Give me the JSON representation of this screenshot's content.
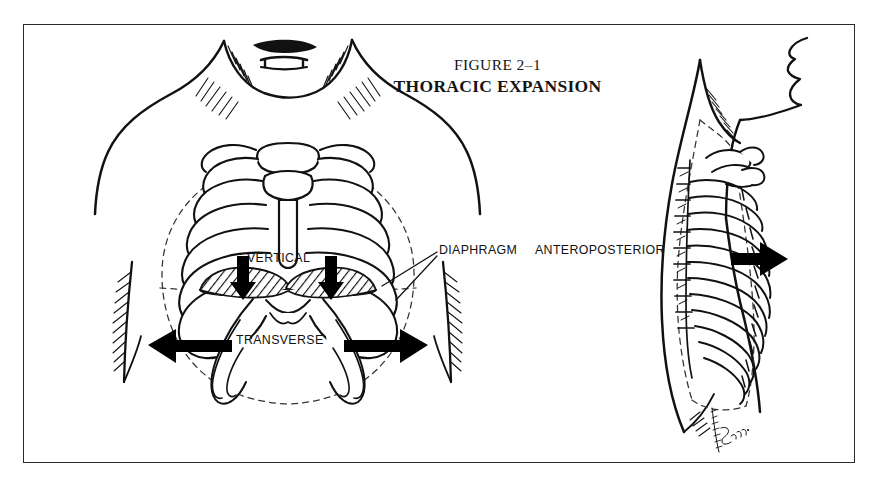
{
  "figure": {
    "number": "FIGURE 2–1",
    "title": "THORACIC EXPANSION",
    "background_color": "#ffffff",
    "ink_color": "#111111",
    "frame_color": "#2a2a2a",
    "artist_signature": "Esposito"
  },
  "labels": {
    "vertical": "VERTICAL",
    "transverse": "TRANSVERSE",
    "diaphragm": "DIAPHRAGM",
    "anteroposterior": "ANTEROPOSTERIOR"
  },
  "panels": [
    {
      "id": "anterior-view",
      "name": "Anterior thorax view",
      "dimensions_shown": [
        "VERTICAL",
        "TRANSVERSE"
      ],
      "structures": [
        "sternum",
        "manubrium",
        "ribs",
        "costal-cartilage",
        "diaphragm",
        "neck",
        "shoulders",
        "arms"
      ]
    },
    {
      "id": "lateral-view",
      "name": "Lateral thorax view",
      "dimensions_shown": [
        "ANTEROPOSTERIOR"
      ],
      "structures": [
        "ribs",
        "vertebral-column",
        "scapula",
        "head-profile",
        "neck"
      ]
    }
  ],
  "arrows": [
    {
      "name": "vertical-arrow-left",
      "direction": "down",
      "panel": "anterior-view"
    },
    {
      "name": "vertical-arrow-right",
      "direction": "down",
      "panel": "anterior-view"
    },
    {
      "name": "transverse-arrow-left",
      "direction": "left",
      "panel": "anterior-view"
    },
    {
      "name": "transverse-arrow-right",
      "direction": "right",
      "panel": "anterior-view"
    },
    {
      "name": "anteroposterior-arrow",
      "direction": "right",
      "panel": "lateral-view"
    }
  ]
}
